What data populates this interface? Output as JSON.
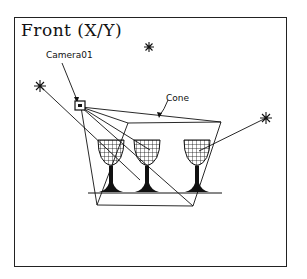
{
  "viewport": {
    "title": "Front (X/Y)"
  },
  "labels": {
    "camera": "Camera01",
    "cone": "Cone"
  },
  "objects": {
    "lights": [
      "light-omni-left",
      "light-omni-top",
      "light-omni-right"
    ],
    "glasses": 3
  },
  "colors": {
    "line": "#111111",
    "background": "#ffffff"
  }
}
